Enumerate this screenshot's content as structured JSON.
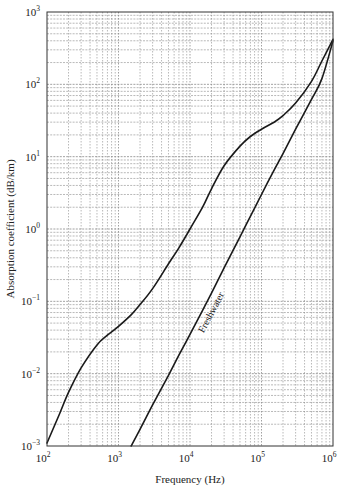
{
  "chart_data": {
    "type": "line",
    "title": "",
    "xlabel": "Frequency (Hz)",
    "ylabel": "Absorption coefficient (dB/km)",
    "xscale": "log",
    "yscale": "log",
    "xlim": [
      100,
      1000000
    ],
    "ylim": [
      0.001,
      1000
    ],
    "grid": true,
    "grid_style": "dotted major and minor log gridlines",
    "x_ticks": [
      {
        "base": "10",
        "exp": "2",
        "value": 100
      },
      {
        "base": "10",
        "exp": "3",
        "value": 1000
      },
      {
        "base": "10",
        "exp": "4",
        "value": 10000
      },
      {
        "base": "10",
        "exp": "5",
        "value": 100000
      },
      {
        "base": "10",
        "exp": "6",
        "value": 1000000
      }
    ],
    "y_ticks": [
      {
        "base": "10",
        "exp": "−3",
        "value": 0.001
      },
      {
        "base": "10",
        "exp": "−2",
        "value": 0.01
      },
      {
        "base": "10",
        "exp": "−1",
        "value": 0.1
      },
      {
        "base": "10",
        "exp": "0",
        "value": 1
      },
      {
        "base": "10",
        "exp": "1",
        "value": 10
      },
      {
        "base": "10",
        "exp": "2",
        "value": 100
      },
      {
        "base": "10",
        "exp": "3",
        "value": 1000
      }
    ],
    "legend": null,
    "annotations": [
      {
        "text": "Freshwater",
        "rotation_deg": -62,
        "attached_to": "Freshwater"
      }
    ],
    "series": [
      {
        "name": "Seawater",
        "label_visible": false,
        "x": [
          100,
          150,
          200,
          300,
          500,
          700,
          1000,
          1500,
          2000,
          3000,
          5000,
          7000,
          10000,
          15000,
          20000,
          30000,
          50000,
          70000,
          100000,
          150000,
          200000,
          300000,
          500000,
          700000,
          1000000
        ],
        "y": [
          0.0011,
          0.0028,
          0.0055,
          0.012,
          0.025,
          0.034,
          0.045,
          0.065,
          0.09,
          0.15,
          0.33,
          0.55,
          1.0,
          2.0,
          3.6,
          7.5,
          14,
          19,
          24,
          30,
          37,
          55,
          110,
          210,
          420
        ]
      },
      {
        "name": "Freshwater",
        "label_visible": true,
        "x": [
          1500,
          2000,
          3000,
          5000,
          7000,
          10000,
          15000,
          20000,
          30000,
          50000,
          70000,
          100000,
          150000,
          200000,
          300000,
          500000,
          700000,
          1000000
        ],
        "y": [
          0.001,
          0.0017,
          0.0037,
          0.0095,
          0.018,
          0.035,
          0.075,
          0.13,
          0.29,
          0.78,
          1.5,
          3.0,
          6.5,
          11,
          24,
          62,
          120,
          400
        ]
      }
    ]
  },
  "colors": {
    "curve": "#1a1a1a",
    "grid": "#8a8a8a",
    "axis": "#333333",
    "background": "#ffffff"
  }
}
